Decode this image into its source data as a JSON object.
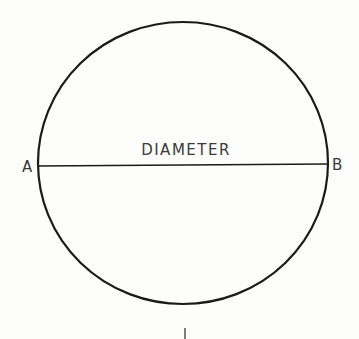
{
  "diagram": {
    "title_label": "DIAMETER",
    "point_a": "A",
    "point_b": "B",
    "bottom_mark": "I",
    "colors": {
      "stroke": "#1a1a1a",
      "text": "#3a3a3a",
      "background": "#fdfdfb"
    }
  }
}
